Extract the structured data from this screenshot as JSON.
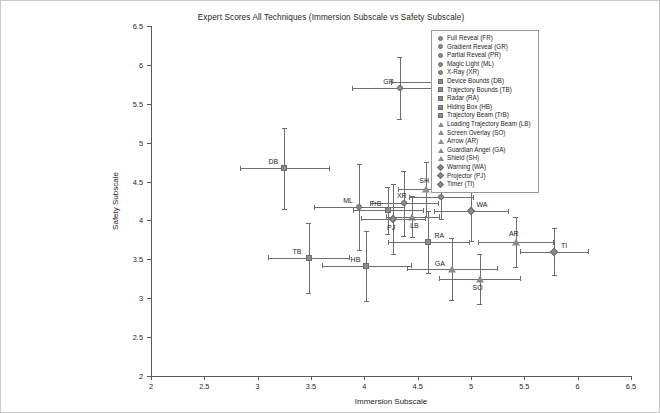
{
  "chart_data": {
    "type": "scatter",
    "title": "Expert Scores All Techniques (Immersion Subscale vs Safety Subscale)",
    "xlabel": "Immersion Subscale",
    "ylabel": "Safety Subscale",
    "xlim": [
      2,
      6.5
    ],
    "ylim": [
      2,
      6.5
    ],
    "xticks": [
      "2",
      "2.5",
      "3",
      "3.5",
      "4",
      "4.5",
      "5",
      "5.5",
      "6",
      "6.5"
    ],
    "yticks": [
      "2",
      "2.5",
      "3",
      "3.5",
      "4",
      "4.5",
      "5",
      "5.5",
      "6",
      "6.5"
    ],
    "grid": false,
    "legend_position": "top-right",
    "error_bars": "both",
    "marker_color": "#8c8c8c",
    "points": [
      {
        "code": "FR",
        "name": "Full Reveal (FR)",
        "marker": "circle",
        "x": 4.67,
        "y": 5.78,
        "xerr": 0.42,
        "yerr": 0.36,
        "lx": 10,
        "ly": -7
      },
      {
        "code": "GR",
        "name": "Gradient Reveal (GR)",
        "marker": "circle",
        "x": 4.33,
        "y": 5.7,
        "xerr": 0.45,
        "yerr": 0.4,
        "lx": -11,
        "ly": -7
      },
      {
        "code": "PR",
        "name": "Partial Reveal (PR)",
        "marker": "circle",
        "x": 4.72,
        "y": 4.3,
        "xerr": 0.3,
        "yerr": 0.28,
        "lx": 10,
        "ly": -7
      },
      {
        "code": "ML",
        "name": "Magic Light (ML)",
        "marker": "circle",
        "x": 3.95,
        "y": 4.17,
        "xerr": 0.42,
        "yerr": 0.55,
        "lx": -11,
        "ly": -7
      },
      {
        "code": "XR",
        "name": "X-Ray (XR)",
        "marker": "circle",
        "x": 4.37,
        "y": 4.22,
        "xerr": 0.32,
        "yerr": 0.42,
        "lx": -2,
        "ly": -8
      },
      {
        "code": "DB",
        "name": "Device Bounds (DB)",
        "marker": "square",
        "x": 3.25,
        "y": 4.67,
        "xerr": 0.42,
        "yerr": 0.52,
        "lx": -11,
        "ly": -7
      },
      {
        "code": "TB",
        "name": "Trajectory Bounds (TB)",
        "marker": "square",
        "x": 3.48,
        "y": 3.52,
        "xerr": 0.38,
        "yerr": 0.45,
        "lx": -12,
        "ly": -7
      },
      {
        "code": "RA",
        "name": "Radar (RA)",
        "marker": "square",
        "x": 4.6,
        "y": 3.72,
        "xerr": 0.38,
        "yerr": 0.4,
        "lx": 11,
        "ly": -7
      },
      {
        "code": "HB",
        "name": "Hiding Box (HB)",
        "marker": "square",
        "x": 4.02,
        "y": 3.42,
        "xerr": 0.42,
        "yerr": 0.45,
        "lx": -11,
        "ly": -7
      },
      {
        "code": "TrB",
        "name": "Trajectory Beam (TrB)",
        "marker": "square",
        "x": 4.22,
        "y": 4.13,
        "xerr": 0.33,
        "yerr": 0.3,
        "lx": -12,
        "ly": -7
      },
      {
        "code": "LB",
        "name": "Loading Trajectory Beam (LB)",
        "marker": "triangle",
        "x": 4.45,
        "y": 4.05,
        "xerr": 0.25,
        "yerr": 0.26,
        "lx": 2,
        "ly": 8
      },
      {
        "code": "SO",
        "name": "Screen Overlay (SO)",
        "marker": "triangle",
        "x": 5.08,
        "y": 3.25,
        "xerr": 0.38,
        "yerr": 0.32,
        "lx": -2,
        "ly": 8
      },
      {
        "code": "AR",
        "name": "Arrow (AR)",
        "marker": "triangle",
        "x": 5.42,
        "y": 3.72,
        "xerr": 0.35,
        "yerr": 0.32,
        "lx": -2,
        "ly": -9
      },
      {
        "code": "GA",
        "name": "Guardian Angel (GA)",
        "marker": "triangle",
        "x": 4.82,
        "y": 3.38,
        "xerr": 0.42,
        "yerr": 0.4,
        "lx": -12,
        "ly": -6
      },
      {
        "code": "SH",
        "name": "Shield (SH)",
        "marker": "triangle",
        "x": 4.58,
        "y": 4.4,
        "xerr": 0.26,
        "yerr": 0.35,
        "lx": -2,
        "ly": -9
      },
      {
        "code": "WA",
        "name": "Warning (WA)",
        "marker": "diamond",
        "x": 5.0,
        "y": 4.12,
        "xerr": 0.35,
        "yerr": 0.38,
        "lx": 11,
        "ly": -7
      },
      {
        "code": "PJ",
        "name": "Projector (PJ)",
        "marker": "diamond",
        "x": 4.27,
        "y": 4.02,
        "xerr": 0.3,
        "yerr": 0.45,
        "lx": -2,
        "ly": 8
      },
      {
        "code": "TI",
        "name": "Timer (TI)",
        "marker": "diamond",
        "x": 5.78,
        "y": 3.6,
        "xerr": 0.32,
        "yerr": 0.3,
        "lx": 10,
        "ly": -7
      }
    ]
  },
  "legend": {
    "items": [
      {
        "label": "Full Reveal (FR)",
        "marker": "circle"
      },
      {
        "label": "Gradient Reveal (GR)",
        "marker": "circle"
      },
      {
        "label": "Partial Reveal (PR)",
        "marker": "circle"
      },
      {
        "label": "Magic Light (ML)",
        "marker": "circle"
      },
      {
        "label": "X-Ray (XR)",
        "marker": "circle"
      },
      {
        "label": "Device Bounds (DB)",
        "marker": "square"
      },
      {
        "label": "Trajectory Bounds (TB)",
        "marker": "square"
      },
      {
        "label": "Radar (RA)",
        "marker": "square"
      },
      {
        "label": "Hiding Box (HB)",
        "marker": "square"
      },
      {
        "label": "Trajectory Beam (TrB)",
        "marker": "square"
      },
      {
        "label": "Loading Trajectory Beam (LB)",
        "marker": "triangle"
      },
      {
        "label": "Screen Overlay (SO)",
        "marker": "triangle"
      },
      {
        "label": "Arrow (AR)",
        "marker": "triangle"
      },
      {
        "label": "Guardian Angel (GA)",
        "marker": "triangle"
      },
      {
        "label": "Shield (SH)",
        "marker": "triangle"
      },
      {
        "label": "Warning (WA)",
        "marker": "diamond"
      },
      {
        "label": "Projector (PJ)",
        "marker": "diamond"
      },
      {
        "label": "Timer (TI)",
        "marker": "diamond"
      }
    ]
  }
}
